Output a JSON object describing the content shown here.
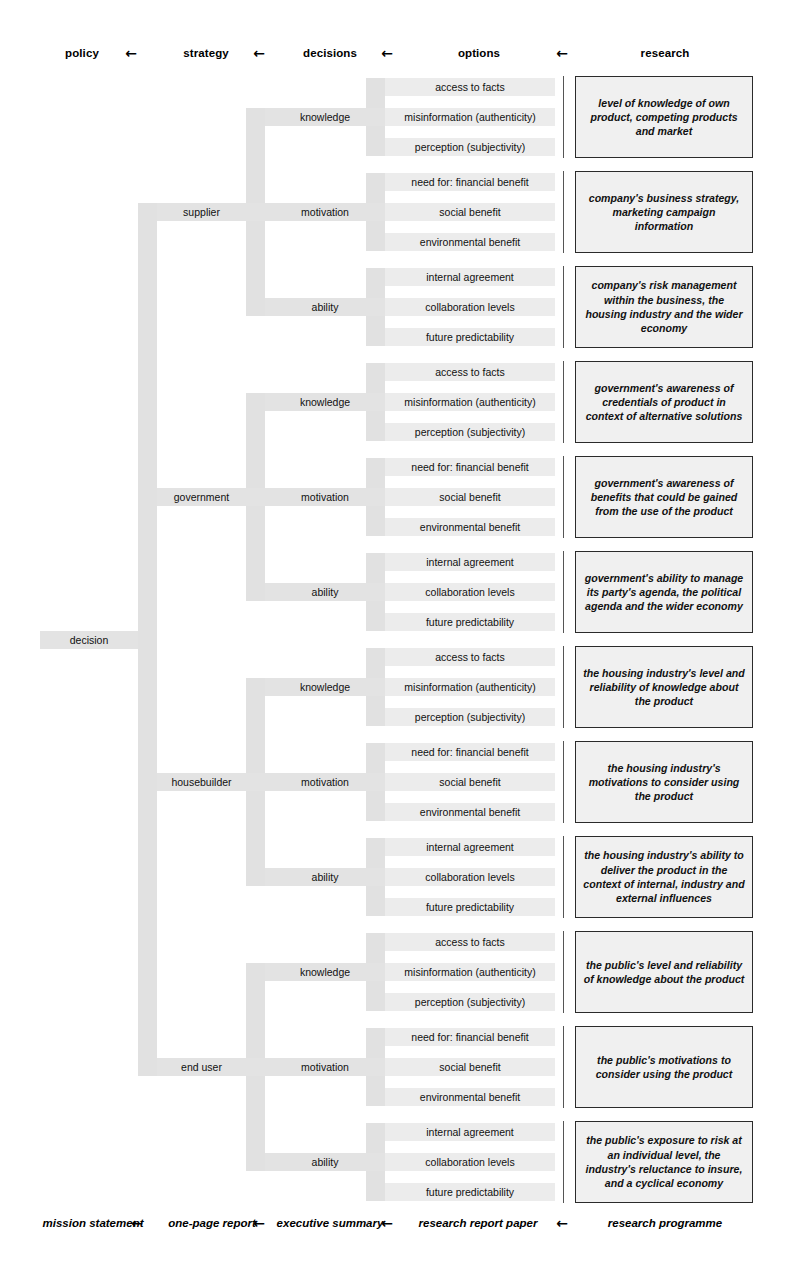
{
  "header": {
    "columns": [
      "policy",
      "strategy",
      "decisions",
      "options",
      "research"
    ],
    "arrow": "←"
  },
  "footer": {
    "columns": [
      "mission statement",
      "one-page report",
      "executive summary",
      "research report paper",
      "research programme"
    ],
    "arrow": "←"
  },
  "root": {
    "label": "decision"
  },
  "option_sets": {
    "knowledge": [
      "access to facts",
      "misinformation (authenticity)",
      "perception (subjectivity)"
    ],
    "motivation": [
      "need for: financial benefit",
      "social benefit",
      "environmental benefit"
    ],
    "ability": [
      "internal agreement",
      "collaboration levels",
      "future predictability"
    ]
  },
  "colors": {
    "band": "#e3e3e3",
    "option_band": "#ececec",
    "box_fill": "#f0f0f0",
    "box_border": "#2b2b2b",
    "separator": "#555555",
    "text": "#111111"
  },
  "strategies": [
    {
      "label": "supplier",
      "decisions": [
        {
          "label": "knowledge",
          "options": [
            "access to facts",
            "misinformation (authenticity)",
            "perception (subjectivity)"
          ],
          "research": "level of knowledge of own product, competing products and market"
        },
        {
          "label": "motivation",
          "options": [
            "need for: financial benefit",
            "social benefit",
            "environmental benefit"
          ],
          "research": "company's business strategy, marketing campaign information"
        },
        {
          "label": "ability",
          "options": [
            "internal agreement",
            "collaboration levels",
            "future predictability"
          ],
          "research": "company's risk management within the business, the housing industry and the wider economy"
        }
      ]
    },
    {
      "label": "government",
      "decisions": [
        {
          "label": "knowledge",
          "options": [
            "access to facts",
            "misinformation (authenticity)",
            "perception (subjectivity)"
          ],
          "research": "government's awareness of credentials of product in context of alternative solutions"
        },
        {
          "label": "motivation",
          "options": [
            "need for: financial benefit",
            "social benefit",
            "environmental benefit"
          ],
          "research": "government's awareness of benefits that could be gained from the use of the product"
        },
        {
          "label": "ability",
          "options": [
            "internal agreement",
            "collaboration levels",
            "future predictability"
          ],
          "research": "government's ability to manage its party's agenda, the political agenda and the wider economy"
        }
      ]
    },
    {
      "label": "housebuilder",
      "decisions": [
        {
          "label": "knowledge",
          "options": [
            "access to facts",
            "misinformation (authenticity)",
            "perception (subjectivity)"
          ],
          "research": "the housing industry's level and reliability of knowledge about the product"
        },
        {
          "label": "motivation",
          "options": [
            "need for: financial benefit",
            "social benefit",
            "environmental benefit"
          ],
          "research": "the housing industry's motivations to consider using the product"
        },
        {
          "label": "ability",
          "options": [
            "internal agreement",
            "collaboration levels",
            "future predictability"
          ],
          "research": "the housing industry's ability to deliver the product in the context of internal, industry and external influences"
        }
      ]
    },
    {
      "label": "end user",
      "decisions": [
        {
          "label": "knowledge",
          "options": [
            "access to facts",
            "misinformation (authenticity)",
            "perception (subjectivity)"
          ],
          "research": "the public's level and reliability of knowledge about the product"
        },
        {
          "label": "motivation",
          "options": [
            "need for: financial benefit",
            "social benefit",
            "environmental benefit"
          ],
          "research": "the public's motivations to consider using the product"
        },
        {
          "label": "ability",
          "options": [
            "internal agreement",
            "collaboration levels",
            "future predictability"
          ],
          "research": "the public's exposure to risk at an individual level, the industry's reluctance to insure, and a cyclical economy"
        }
      ]
    }
  ]
}
